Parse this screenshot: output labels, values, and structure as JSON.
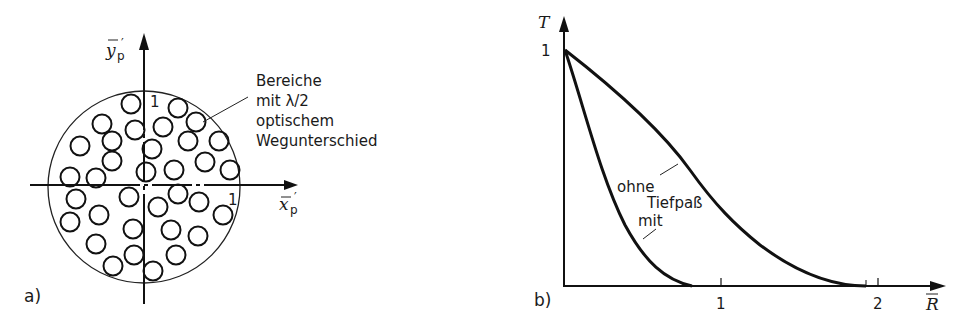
{
  "panel_a": {
    "label": "a)",
    "x_axis_label": "x",
    "x_axis_sub": "p",
    "y_axis_label": "y",
    "y_axis_sub": "p",
    "x_tick": "1",
    "y_tick": "1",
    "annotation": [
      "Bereiche",
      "mit λ/2",
      "optischem",
      "Wegunterschied"
    ],
    "outer_circle": {
      "cx": 144,
      "cy": 187,
      "r": 96
    },
    "small_circle_radius": 9.5,
    "small_circles": [
      [
        131,
        104
      ],
      [
        102,
        124
      ],
      [
        135,
        130
      ],
      [
        112,
        141
      ],
      [
        80,
        146
      ],
      [
        112,
        161
      ],
      [
        70,
        177
      ],
      [
        96,
        178
      ],
      [
        178,
        108
      ],
      [
        163,
        127
      ],
      [
        196,
        122
      ],
      [
        188,
        141
      ],
      [
        219,
        141
      ],
      [
        152,
        149
      ],
      [
        146,
        172
      ],
      [
        174,
        170
      ],
      [
        205,
        162
      ],
      [
        230,
        170
      ],
      [
        76,
        199
      ],
      [
        70,
        222
      ],
      [
        99,
        215
      ],
      [
        129,
        197
      ],
      [
        96,
        244
      ],
      [
        133,
        229
      ],
      [
        113,
        266
      ],
      [
        134,
        255
      ],
      [
        178,
        194
      ],
      [
        158,
        207
      ],
      [
        199,
        202
      ],
      [
        171,
        230
      ],
      [
        198,
        236
      ],
      [
        223,
        215
      ],
      [
        176,
        255
      ],
      [
        153,
        271
      ]
    ]
  },
  "panel_b": {
    "label": "b)",
    "y_axis_label": "T",
    "x_axis_label": "R",
    "y_tick": "1",
    "x_ticks": [
      "1",
      "2"
    ],
    "curve_labels": {
      "ohne": "ohne",
      "tiefpass": "Tiefpaß",
      "mit": "mit"
    }
  },
  "chart_data": {
    "type": "line",
    "title": "",
    "xlabel": "R̄",
    "ylabel": "T",
    "xlim": [
      0,
      2.3
    ],
    "ylim": [
      0,
      1.1
    ],
    "x_ticks": [
      1,
      2
    ],
    "y_ticks": [
      1
    ],
    "grid": false,
    "series": [
      {
        "name": "ohne Tiefpaß",
        "x": [
          0,
          0.25,
          0.5,
          0.75,
          1.0,
          1.25,
          1.5,
          1.75,
          1.92
        ],
        "y": [
          1.0,
          0.83,
          0.67,
          0.51,
          0.37,
          0.24,
          0.12,
          0.03,
          0.0
        ]
      },
      {
        "name": "mit Tiefpaß",
        "x": [
          0,
          0.1,
          0.2,
          0.3,
          0.4,
          0.5,
          0.6,
          0.7,
          0.82
        ],
        "y": [
          1.0,
          0.79,
          0.6,
          0.44,
          0.3,
          0.19,
          0.1,
          0.04,
          0.0
        ]
      }
    ]
  }
}
